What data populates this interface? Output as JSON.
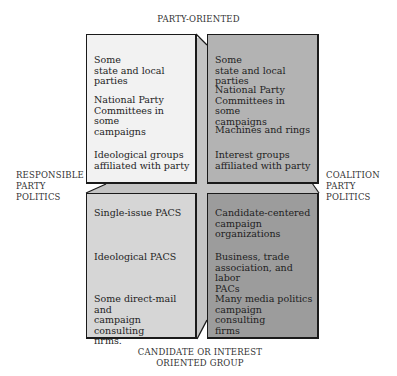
{
  "diagram": {
    "axes": {
      "top": "PARTY-ORIENTED",
      "bottom": [
        "CANDIDATE OR INTEREST",
        "ORIENTED GROUP"
      ],
      "left": [
        "RESPONSIBLE",
        "PARTY",
        "POLITICS"
      ],
      "right": [
        "COALITION",
        "PARTY",
        "POLITICS"
      ]
    },
    "quadrants": {
      "top_left": {
        "fill": "#f2f2f2",
        "items": [
          [
            "Some",
            "state and local parties"
          ],
          [
            "National Party",
            "Committees in some",
            "campaigns"
          ],
          [
            "Ideological groups",
            "affiliated with party"
          ]
        ]
      },
      "top_right": {
        "fill": "#b3b3b3",
        "items": [
          [
            "Some",
            "state and local parties"
          ],
          [
            "National Party",
            "Committees in some",
            "campaigns"
          ],
          [
            "Machines and rings"
          ],
          [
            "Interest groups",
            "affiliated with party"
          ]
        ]
      },
      "bottom_left": {
        "fill": "#d6d6d6",
        "items": [
          [
            "Single-issue PACS"
          ],
          [
            "Ideological PACS"
          ],
          [
            "Some direct-mail and",
            "campaign consulting",
            "firms."
          ]
        ]
      },
      "bottom_right": {
        "fill": "#9c9c9c",
        "items": [
          [
            "Candidate-centered",
            "campaign",
            "organizations"
          ],
          [
            "Business, trade",
            "association, and labor",
            "PACs"
          ],
          [
            "Many media politics",
            "campaign consulting",
            "firms"
          ]
        ]
      }
    },
    "cross_color": "#c4c4c4"
  }
}
